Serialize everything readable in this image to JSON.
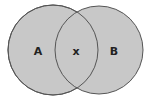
{
  "diagram": {
    "type": "venn",
    "colors": {
      "fill": "#c8c8c8",
      "stroke": "#555555",
      "background": "#ffffff"
    },
    "sets": [
      {
        "id": "A",
        "label": "A",
        "cx": 53,
        "cy": 50,
        "r": 45
      },
      {
        "id": "B",
        "label": "B",
        "cx": 99,
        "cy": 50,
        "r": 44
      }
    ],
    "intersection": {
      "label": "x"
    }
  }
}
